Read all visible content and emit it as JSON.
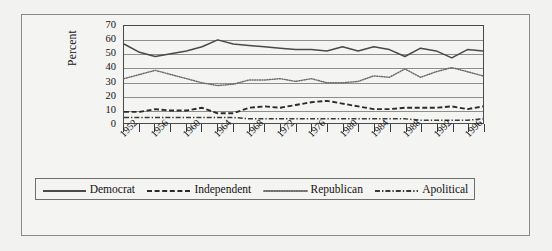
{
  "chart_data": {
    "type": "line",
    "title": "",
    "xlabel": "",
    "ylabel": "Percent",
    "ylim": [
      0,
      70
    ],
    "ytick_step": 10,
    "yticks": [
      0,
      10,
      20,
      30,
      40,
      50,
      60,
      70
    ],
    "xlim": [
      1952,
      1998
    ],
    "grid": "horizontal",
    "legend_position": "bottom",
    "x": [
      1952,
      1954,
      1956,
      1958,
      1960,
      1962,
      1964,
      1966,
      1968,
      1970,
      1972,
      1974,
      1976,
      1978,
      1980,
      1982,
      1984,
      1986,
      1988,
      1990,
      1992,
      1994,
      1996,
      1998
    ],
    "xtick_labels": [
      "1952",
      "1956",
      "1960",
      "1964",
      "1968",
      "1972",
      "1976",
      "1980",
      "1984",
      "1988",
      "1992",
      "1996"
    ],
    "xtick_label_values": [
      1952,
      1956,
      1960,
      1964,
      1968,
      1972,
      1976,
      1980,
      1984,
      1988,
      1992,
      1996
    ],
    "series": [
      {
        "name": "Democrat",
        "style": "solid",
        "color": "#4a4a4a",
        "values": [
          57,
          51,
          48,
          50,
          52,
          55,
          60,
          57,
          56,
          55,
          54,
          53,
          53,
          52,
          55,
          52,
          55,
          53,
          48,
          54,
          52,
          47,
          53,
          52
        ]
      },
      {
        "name": "Independent",
        "style": "dashed",
        "color": "#2b2b2b",
        "values": [
          8,
          8,
          10,
          9,
          9,
          11,
          7,
          7,
          11,
          12,
          11,
          13,
          15,
          16,
          14,
          12,
          10,
          10,
          11,
          11,
          11,
          12,
          10,
          12
        ]
      },
      {
        "name": "Republican",
        "style": "dotted",
        "color": "#6b6b6b",
        "values": [
          32,
          35,
          38,
          35,
          32,
          29,
          27,
          28,
          31,
          31,
          32,
          30,
          32,
          29,
          29,
          30,
          34,
          33,
          39,
          33,
          37,
          40,
          37,
          34
        ]
      },
      {
        "name": "Apolitical",
        "style": "dashdot",
        "color": "#3a3a3a",
        "values": [
          4,
          4,
          4,
          4,
          4,
          4,
          4,
          4,
          3,
          3,
          3,
          3,
          3,
          3,
          3,
          3,
          3,
          3,
          3,
          2,
          2,
          2,
          2,
          3
        ]
      }
    ]
  },
  "legend": {
    "entries": [
      {
        "label": "Democrat",
        "style": "solid"
      },
      {
        "label": "Independent",
        "style": "dashed"
      },
      {
        "label": "Republican",
        "style": "dotted"
      },
      {
        "label": "Apolitical",
        "style": "dashdot"
      }
    ]
  },
  "colors": {
    "figure_background": "#f2f2f0",
    "plot_background": "#f4f4f2",
    "frame": "#8a8a88",
    "axis": "#4a4a4a",
    "gridline": "#8e8e8e",
    "text": "#121212"
  }
}
